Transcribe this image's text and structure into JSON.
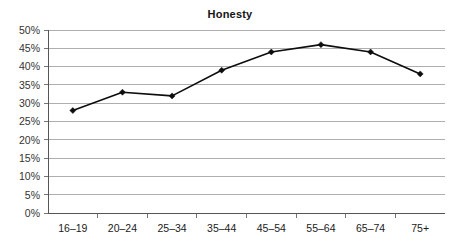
{
  "chart_data": {
    "type": "line",
    "title": "Honesty",
    "xlabel": "",
    "ylabel": "",
    "categories": [
      "16–19",
      "20–24",
      "25–34",
      "35–44",
      "45–54",
      "55–64",
      "65–74",
      "75+"
    ],
    "values": [
      28,
      33,
      32,
      39,
      44,
      46,
      44,
      38
    ],
    "series": [
      {
        "name": "Honesty",
        "values": [
          28,
          33,
          32,
          39,
          44,
          46,
          44,
          38
        ]
      }
    ],
    "ylim": [
      0,
      50
    ],
    "ytick_step": 5,
    "ytick_labels": [
      "0%",
      "5%",
      "10%",
      "15%",
      "20%",
      "25%",
      "30%",
      "35%",
      "40%",
      "45%",
      "50%"
    ],
    "ytick_values": [
      0,
      5,
      10,
      15,
      20,
      25,
      30,
      35,
      40,
      45,
      50
    ],
    "value_format": "percent",
    "grid": true,
    "grid_axis": "y",
    "legend": false,
    "legend_position": "none",
    "marker": "diamond",
    "colors": {
      "line": "#0d0d0d",
      "marker": "#0d0d0d",
      "gridline": "#9a9a9a",
      "axis": "#555555",
      "title": "#141414",
      "tick_label": "#333333",
      "background": "#ffffff"
    }
  }
}
